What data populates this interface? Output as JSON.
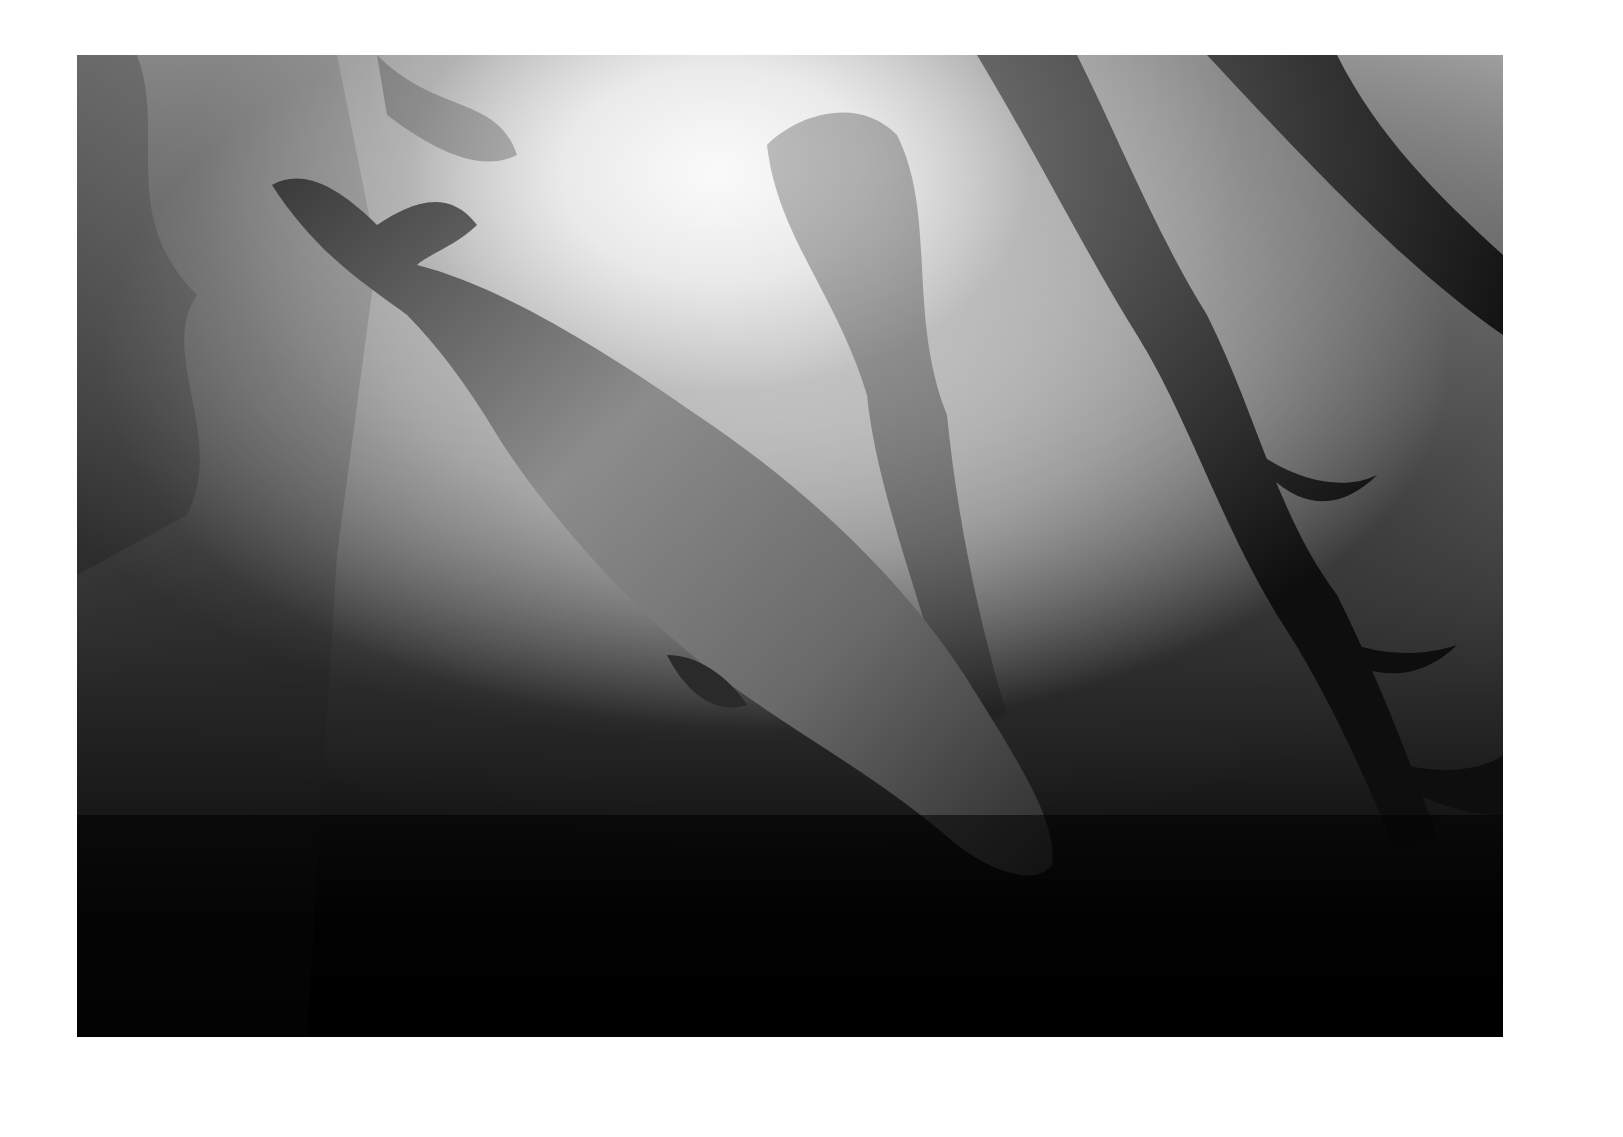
{
  "image": {
    "subject": "harbor seal diving through kelp forest",
    "style": "black-and-white underwater photograph",
    "border_color": "#ffffff",
    "tones": {
      "highlight": "#f4f4f4",
      "midtone": "#8a8a8a",
      "shadow": "#000000"
    }
  }
}
